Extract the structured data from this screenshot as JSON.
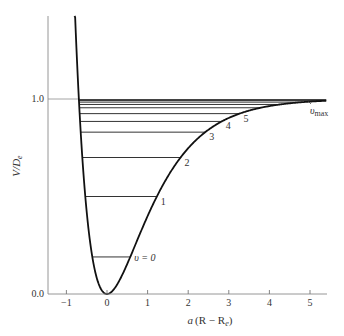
{
  "chart_data": {
    "type": "line",
    "title": "",
    "xlabel": "a(R − Re)",
    "ylabel": "V/De",
    "xlim": [
      -1.45,
      5.4
    ],
    "ylim": [
      0.0,
      1.43
    ],
    "grid": false,
    "xticks": [
      -1,
      0,
      1,
      2,
      3,
      4,
      5
    ],
    "xtick_labels": [
      "−1",
      "0",
      "1",
      "2",
      "3",
      "4",
      "5"
    ],
    "yticks": [
      0.0,
      1.0
    ],
    "ytick_labels": [
      "0.0",
      "1.0"
    ],
    "curve": {
      "name": "Morse potential V/De = (1 − e^(−a(R−Re)))²",
      "x_range": [
        -0.8,
        5.4
      ]
    },
    "dissociation_line": {
      "y": 1.0,
      "color": "#999999"
    },
    "vibrational_levels": [
      {
        "v": 0,
        "label": "υ = 0",
        "energy": 0.19
      },
      {
        "v": 1,
        "label": "1",
        "energy": 0.5
      },
      {
        "v": 2,
        "label": "2",
        "energy": 0.7
      },
      {
        "v": 3,
        "label": "3",
        "energy": 0.83
      },
      {
        "v": 4,
        "label": "4",
        "energy": 0.885
      },
      {
        "v": 5,
        "label": "5",
        "energy": 0.925
      },
      {
        "v": 6,
        "label": "",
        "energy": 0.955
      },
      {
        "v": 7,
        "label": "",
        "energy": 0.972
      },
      {
        "v": 8,
        "label": "",
        "energy": 0.984
      },
      {
        "v": 9,
        "label": "",
        "energy": 0.992
      },
      {
        "v": 10,
        "label": "",
        "energy": 0.997
      }
    ],
    "annotations": [
      {
        "text": "υmax",
        "x": 4.9,
        "y": 1.0
      }
    ],
    "colors": {
      "curve": "#111111",
      "axis": "#777777",
      "levels": "#333333"
    }
  },
  "labels": {
    "ylabel_main": "V/D",
    "ylabel_sub": "e",
    "xlabel_prefix": "a",
    "xlabel_main": "(R − R",
    "xlabel_sub": "e",
    "xlabel_close": ")",
    "vmax_main": "υ",
    "vmax_sub": "max"
  }
}
